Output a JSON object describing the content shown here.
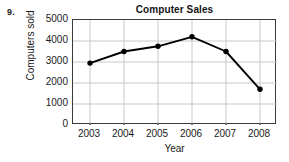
{
  "worksheet": {
    "problem_number": "9."
  },
  "chart_data": {
    "type": "line",
    "title": "Computer Sales",
    "xlabel": "Year",
    "ylabel": "Computers sold",
    "categories": [
      "2003",
      "2004",
      "2005",
      "2006",
      "2007",
      "2008"
    ],
    "values": [
      2950,
      3500,
      3750,
      4200,
      3500,
      1700
    ],
    "series": [
      {
        "name": "Computers sold",
        "values": [
          2950,
          3500,
          3750,
          4200,
          3500,
          1700
        ]
      }
    ],
    "ylim": [
      0,
      5000
    ],
    "yticks": [
      "0",
      "1000",
      "2000",
      "3000",
      "4000",
      "5000"
    ],
    "ytick_values": [
      0,
      1000,
      2000,
      3000,
      4000,
      5000
    ],
    "xticks": [
      "2003",
      "2004",
      "2005",
      "2006",
      "2007",
      "2008"
    ],
    "grid": true,
    "legend": false,
    "legend_position": "none",
    "colors": {
      "line": "#000000",
      "marker": "#000000",
      "grid": "#c8c8c8",
      "frame": "#3a3a3a",
      "background": "#ffffff",
      "text": "#1a1a1a"
    }
  }
}
